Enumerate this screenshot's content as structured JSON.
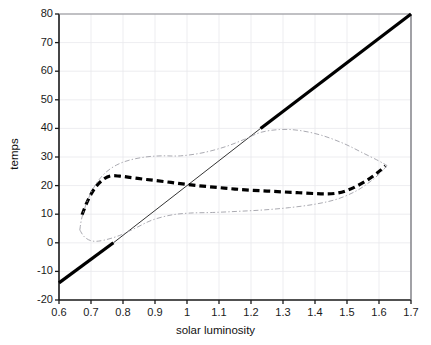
{
  "chart_data": {
    "type": "line",
    "title": "",
    "xlabel": "solar luminosity",
    "ylabel": "temps",
    "xlim": [
      0.6,
      1.7
    ],
    "ylim": [
      -20,
      80
    ],
    "xticks": [
      0.6,
      0.7,
      0.8,
      0.9,
      1,
      1.1,
      1.2,
      1.3,
      1.4,
      1.5,
      1.6,
      1.7
    ],
    "xticklabels": [
      "0.6",
      "0.7",
      "0.8",
      "0.9",
      "1",
      "1.1",
      "1.2",
      "1.3",
      "1.4",
      "1.5",
      "1.6",
      "1.7"
    ],
    "yticks": [
      -20,
      -10,
      0,
      10,
      20,
      30,
      40,
      50,
      60,
      70,
      80
    ],
    "yticklabels": [
      "-20",
      "-10",
      "0",
      "10",
      "20",
      "30",
      "40",
      "50",
      "60",
      "70",
      "80"
    ],
    "grid": true,
    "grid_color": "#e8e8ec",
    "legend": "none",
    "axes_color": "#1a1a1a",
    "series": [
      {
        "name": "ice-free branch (straight line)",
        "style": "solid",
        "color": "#000000",
        "segments": [
          {
            "weight": "thick",
            "linewidth": 3.2,
            "points": [
              [
                0.6,
                -14.0
              ],
              [
                0.77,
                0.0
              ]
            ]
          },
          {
            "weight": "thin",
            "linewidth": 0.8,
            "points": [
              [
                0.77,
                0.0
              ],
              [
                1.0,
                20.0
              ],
              [
                1.23,
                40.0
              ]
            ]
          },
          {
            "weight": "thick",
            "linewidth": 3.2,
            "points": [
              [
                1.23,
                40.0
              ],
              [
                1.7,
                80.0
              ]
            ]
          }
        ]
      },
      {
        "name": "mean temperature branch (heavy dashed)",
        "style": "dashed",
        "color": "#000000",
        "linewidth": 3.2,
        "points": [
          [
            0.672,
            9.8
          ],
          [
            0.685,
            13.5
          ],
          [
            0.7,
            17.0
          ],
          [
            0.718,
            20.0
          ],
          [
            0.74,
            22.3
          ],
          [
            0.762,
            23.4
          ],
          [
            0.79,
            23.3
          ],
          [
            0.82,
            22.9
          ],
          [
            0.86,
            22.3
          ],
          [
            0.9,
            21.8
          ],
          [
            0.95,
            21.1
          ],
          [
            1.0,
            20.4
          ],
          [
            1.05,
            19.8
          ],
          [
            1.1,
            19.3
          ],
          [
            1.15,
            18.8
          ],
          [
            1.2,
            18.4
          ],
          [
            1.25,
            18.1
          ],
          [
            1.3,
            17.8
          ],
          [
            1.35,
            17.5
          ],
          [
            1.4,
            17.2
          ],
          [
            1.44,
            17.1
          ],
          [
            1.47,
            17.4
          ],
          [
            1.5,
            18.3
          ],
          [
            1.53,
            19.8
          ],
          [
            1.56,
            21.7
          ],
          [
            1.585,
            23.6
          ],
          [
            1.605,
            25.4
          ],
          [
            1.62,
            26.9
          ]
        ]
      },
      {
        "name": "envelope upper (light dash-dot)",
        "style": "dashdot",
        "color": "#a0a0a8",
        "linewidth": 0.9,
        "points": [
          [
            0.665,
            4.5
          ],
          [
            0.672,
            9.0
          ],
          [
            0.69,
            15.0
          ],
          [
            0.715,
            20.5
          ],
          [
            0.745,
            24.5
          ],
          [
            0.78,
            27.2
          ],
          [
            0.82,
            28.9
          ],
          [
            0.87,
            30.0
          ],
          [
            0.92,
            30.4
          ],
          [
            0.98,
            30.4
          ],
          [
            1.05,
            31.5
          ],
          [
            1.12,
            33.6
          ],
          [
            1.18,
            36.2
          ],
          [
            1.23,
            38.6
          ],
          [
            1.29,
            39.6
          ],
          [
            1.35,
            39.3
          ],
          [
            1.42,
            37.6
          ],
          [
            1.49,
            34.7
          ],
          [
            1.55,
            31.4
          ],
          [
            1.6,
            28.6
          ],
          [
            1.625,
            27.0
          ]
        ]
      },
      {
        "name": "envelope lower (light dash-dot)",
        "style": "dashdot",
        "color": "#a0a0a8",
        "linewidth": 0.9,
        "points": [
          [
            0.665,
            4.5
          ],
          [
            0.68,
            2.0
          ],
          [
            0.705,
            0.6
          ],
          [
            0.74,
            0.9
          ],
          [
            0.79,
            2.6
          ],
          [
            0.84,
            5.2
          ],
          [
            0.89,
            7.9
          ],
          [
            0.95,
            9.7
          ],
          [
            1.01,
            10.4
          ],
          [
            1.08,
            10.6
          ],
          [
            1.16,
            11.0
          ],
          [
            1.24,
            11.5
          ],
          [
            1.32,
            12.3
          ],
          [
            1.4,
            13.5
          ],
          [
            1.47,
            15.3
          ],
          [
            1.53,
            18.2
          ],
          [
            1.575,
            21.6
          ],
          [
            1.605,
            24.5
          ],
          [
            1.625,
            27.0
          ]
        ]
      }
    ]
  },
  "axis": {
    "xlabel": "solar luminosity",
    "ylabel": "temps"
  }
}
